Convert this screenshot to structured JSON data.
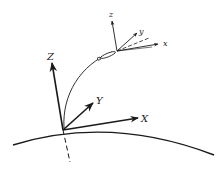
{
  "diagram": {
    "ground_frame": {
      "x_label": "X",
      "y_label": "Y",
      "z_label": "Z"
    },
    "body_frame": {
      "x_label": "x",
      "y_label": "y",
      "z_label": "z"
    },
    "colors": {
      "line": "#1a1a1a",
      "background": "#ffffff"
    }
  }
}
